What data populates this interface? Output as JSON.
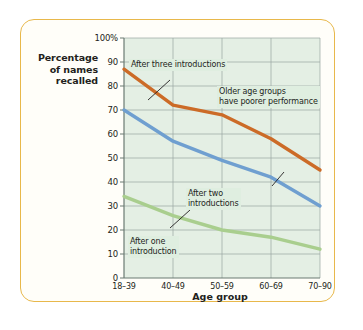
{
  "chart_data": {
    "type": "line",
    "title": "",
    "xlabel": "Age group",
    "ylabel": "Percentage of names recalled",
    "categories": [
      "18–39",
      "40–49",
      "50–59",
      "60–69",
      "70–90"
    ],
    "ylim": [
      0,
      100
    ],
    "yticks": [
      "0",
      "10",
      "20",
      "30",
      "40",
      "50",
      "60",
      "70",
      "80",
      "90",
      "100%"
    ],
    "ytick_values": [
      0,
      10,
      20,
      30,
      40,
      50,
      60,
      70,
      80,
      90,
      100
    ],
    "grid": true,
    "legend": "none",
    "series": [
      {
        "name": "After three introductions",
        "color": "#cc6b27",
        "values": [
          87,
          72,
          68,
          58,
          45
        ]
      },
      {
        "name": "After two introductions",
        "color": "#6f9fd0",
        "values": [
          70,
          57,
          49,
          42,
          30
        ]
      },
      {
        "name": "After one introduction",
        "color": "#a9ce8e",
        "values": [
          34,
          26,
          20,
          17,
          12
        ]
      }
    ],
    "annotations": [
      {
        "id": "after-three-introductions",
        "text": "After three introductions"
      },
      {
        "id": "after-two-introductions",
        "text": "After two\nintroductions"
      },
      {
        "id": "after-one-introduction",
        "text": "After one\nintroduction"
      },
      {
        "id": "older-age-groups-note",
        "text": "Older age groups\nhave poorer performance"
      }
    ]
  },
  "axes": {
    "y_label_line1": "Percentage",
    "y_label_line2": "of names",
    "y_label_line3": "recalled",
    "x_label": "Age group"
  },
  "colors": {
    "border": "#e8b84b",
    "plot_background": "#e4efe4",
    "grid": "#9aa7a0",
    "axis": "#6b7a72",
    "series_three": "#cc6b27",
    "series_two": "#6f9fd0",
    "series_one": "#a9ce8e",
    "callout_background": "#dfeee0",
    "text": "#231f20"
  }
}
